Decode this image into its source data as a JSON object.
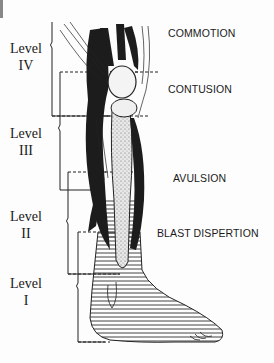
{
  "diagram": {
    "levels": [
      {
        "label": "Level",
        "numeral": "IV"
      },
      {
        "label": "Level",
        "numeral": "III"
      },
      {
        "label": "Level",
        "numeral": "II"
      },
      {
        "label": "Level",
        "numeral": "I"
      }
    ],
    "injury_zones": [
      {
        "label": "COMMOTION"
      },
      {
        "label": "CONTUSION"
      },
      {
        "label": "AVULSION"
      },
      {
        "label": "BLAST DISPERTION"
      }
    ],
    "colors": {
      "ink": "#1a1a1a",
      "background": "#fdfdfd",
      "hatch": "#444444"
    }
  }
}
